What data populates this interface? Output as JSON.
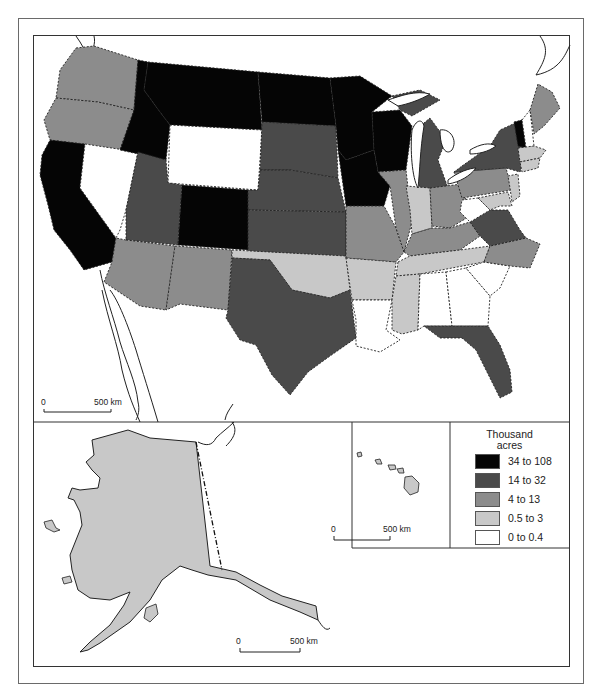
{
  "figure": {
    "type": "choropleth",
    "legend": {
      "title_line1": "Thousand",
      "title_line2": "acres",
      "classes": [
        {
          "label": "34 to 108",
          "color": "#050505"
        },
        {
          "label": "14 to 32",
          "color": "#4a4a4a"
        },
        {
          "label": "4 to 13",
          "color": "#8c8c8c"
        },
        {
          "label": "0.5 to 3",
          "color": "#c8c8c8"
        },
        {
          "label": "0 to 0.4",
          "color": "#ffffff"
        }
      ]
    },
    "scale_bars": {
      "contiguous": {
        "start": "0",
        "end": "500 km"
      },
      "alaska": {
        "start": "0",
        "end": "500 km"
      },
      "hawaii": {
        "start": "0",
        "end": "500 km"
      }
    },
    "state_classes": {
      "34 to 108": [
        "Montana",
        "Idaho",
        "North Dakota",
        "Minnesota",
        "Wisconsin",
        "Iowa",
        "California",
        "Colorado",
        "Vermont"
      ],
      "14 to 32": [
        "South Dakota",
        "Nebraska",
        "Kansas",
        "Utah",
        "Texas",
        "Michigan",
        "New York",
        "Virginia",
        "Florida"
      ],
      "4 to 13": [
        "Washington",
        "Oregon",
        "Arizona",
        "New Mexico",
        "Missouri",
        "Illinois",
        "Ohio",
        "Pennsylvania",
        "Kentucky",
        "North Carolina",
        "Maine"
      ],
      "0.5 to 3": [
        "Oklahoma",
        "Arkansas",
        "Mississippi",
        "Tennessee",
        "Indiana",
        "New Jersey",
        "Massachusetts",
        "Connecticut",
        "Alaska",
        "Hawaii"
      ],
      "0 to 0.4": [
        "Nevada",
        "Wyoming",
        "Louisiana",
        "Alabama",
        "Georgia",
        "South Carolina",
        "West Virginia",
        "New Hampshire"
      ]
    },
    "panels": [
      "contiguous-us",
      "alaska-inset",
      "hawaii-inset",
      "legend"
    ]
  }
}
